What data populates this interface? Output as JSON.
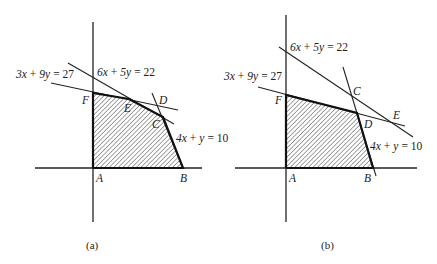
{
  "figure": {
    "panels": [
      {
        "caption": "(a)",
        "constraints": [
          {
            "label_html": "3x + 9y = 27",
            "x": "3x",
            "plus": "+",
            "y": "9y",
            "eq": "= 27"
          },
          {
            "label_html": "6x + 5y = 22",
            "x": "6x",
            "plus": "+",
            "y": "5y",
            "eq": "= 22"
          },
          {
            "label_html": "4x + y = 10",
            "x": "4x",
            "plus": "+",
            "y": "y",
            "eq": "= 10"
          }
        ],
        "vertices": {
          "A": "A",
          "B": "B",
          "C": "C",
          "D": "D",
          "E": "E",
          "F": "F"
        },
        "feasible_region": "A-B-C-E-F (hatched)"
      },
      {
        "caption": "(b)",
        "constraints": [
          {
            "label_html": "3x + 9y = 27",
            "x": "3x",
            "plus": "+",
            "y": "9y",
            "eq": "= 27"
          },
          {
            "label_html": "6x + 5y = 22",
            "x": "6x",
            "plus": "+",
            "y": "5y",
            "eq": "= 22"
          },
          {
            "label_html": "4x + y = 10",
            "x": "4x",
            "plus": "+",
            "y": "y",
            "eq": "= 10"
          }
        ],
        "vertices": {
          "A": "A",
          "B": "B",
          "C": "C",
          "D": "D",
          "E": "E",
          "F": "F"
        },
        "feasible_region": "A-B-D-F (hatched)"
      }
    ]
  }
}
